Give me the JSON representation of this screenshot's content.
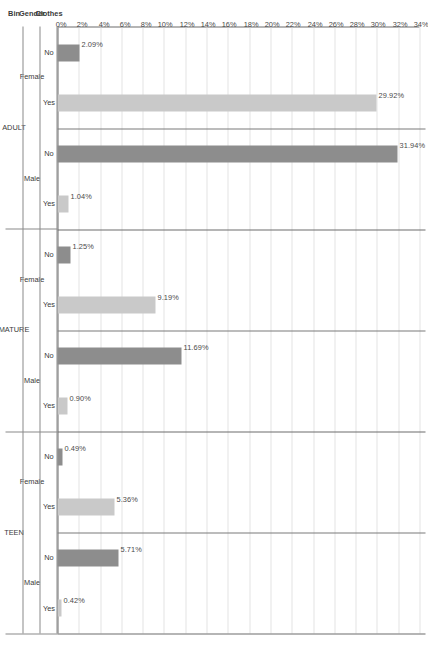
{
  "chart_data": {
    "type": "bar",
    "title": "",
    "xlabel": "",
    "ylabel": "Percentage of Clothes Purchases",
    "orientation": "vertical-rendered-rotated",
    "grid": true,
    "legend": "none",
    "ylim": [
      0,
      34
    ],
    "ytick_step": 2,
    "yticks": [
      "0%",
      "2%",
      "4%",
      "6%",
      "8%",
      "10%",
      "12%",
      "14%",
      "16%",
      "18%",
      "20%",
      "22%",
      "24%",
      "26%",
      "28%",
      "30%",
      "32%",
      "34%"
    ],
    "ytick_values": [
      0,
      2,
      4,
      6,
      8,
      10,
      12,
      14,
      16,
      18,
      20,
      22,
      24,
      26,
      28,
      30,
      32,
      34
    ],
    "category_headers": [
      "Bin",
      "Gender",
      "Clothes"
    ],
    "bars": [
      {
        "bin": "ADULT",
        "gender": "Female",
        "clothes": "No",
        "value": 2.09,
        "label": "2.09%",
        "shade": "no"
      },
      {
        "bin": "ADULT",
        "gender": "Female",
        "clothes": "Yes",
        "value": 29.92,
        "label": "29.92%",
        "shade": "yes"
      },
      {
        "bin": "ADULT",
        "gender": "Male",
        "clothes": "No",
        "value": 31.94,
        "label": "31.94%",
        "shade": "no"
      },
      {
        "bin": "ADULT",
        "gender": "Male",
        "clothes": "Yes",
        "value": 1.04,
        "label": "1.04%",
        "shade": "yes"
      },
      {
        "bin": "MATURE",
        "gender": "Female",
        "clothes": "No",
        "value": 1.25,
        "label": "1.25%",
        "shade": "no"
      },
      {
        "bin": "MATURE",
        "gender": "Female",
        "clothes": "Yes",
        "value": 9.19,
        "label": "9.19%",
        "shade": "yes"
      },
      {
        "bin": "MATURE",
        "gender": "Male",
        "clothes": "No",
        "value": 11.69,
        "label": "11.69%",
        "shade": "no"
      },
      {
        "bin": "MATURE",
        "gender": "Male",
        "clothes": "Yes",
        "value": 0.9,
        "label": "0.90%",
        "shade": "yes"
      },
      {
        "bin": "TEEN",
        "gender": "Female",
        "clothes": "No",
        "value": 0.49,
        "label": "0.49%",
        "shade": "no"
      },
      {
        "bin": "TEEN",
        "gender": "Female",
        "clothes": "Yes",
        "value": 5.36,
        "label": "5.36%",
        "shade": "yes"
      },
      {
        "bin": "TEEN",
        "gender": "Male",
        "clothes": "No",
        "value": 5.71,
        "label": "5.71%",
        "shade": "no"
      },
      {
        "bin": "TEEN",
        "gender": "Male",
        "clothes": "Yes",
        "value": 0.42,
        "label": "0.42%",
        "shade": "yes"
      }
    ],
    "colors": {
      "bar_no": "#8d8d8d",
      "bar_yes": "#c9c9c9",
      "grid": "#e3e3e3",
      "axis": "#6d6d6d",
      "text": "#3a3a3a"
    }
  }
}
